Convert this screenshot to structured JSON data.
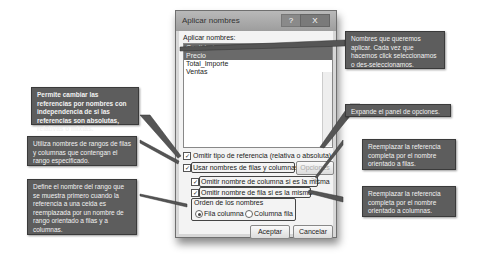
{
  "dialog": {
    "title": "Aplicar nombres",
    "help_button": "?",
    "close_button": "X",
    "list_label": "Aplicar nombres:",
    "names": [
      {
        "label": "Cantidad",
        "selected": true
      },
      {
        "label": "Precio",
        "selected": true
      },
      {
        "label": "Total_Importe",
        "selected": false
      },
      {
        "label": "Ventas",
        "selected": false
      }
    ],
    "omit_reference_type": {
      "label": "Omitir tipo de referencia (relativa o absoluta)",
      "checked": true
    },
    "use_row_column_names": {
      "label": "Usar nombres de filas y columnas",
      "checked": true
    },
    "options_button": "Opciones >>",
    "omit_column_name": {
      "label": "Omitir nombre de columna si es la misma",
      "checked": true
    },
    "omit_row_name": {
      "label": "Omitir nombre de fila si es la misma",
      "checked": true
    },
    "order_group_label": "Orden de los nombres",
    "order_options": [
      {
        "label": "Fila columna",
        "selected": true
      },
      {
        "label": "Columna fila",
        "selected": false
      }
    ],
    "ok_button": "Aceptar",
    "cancel_button": "Cancelar"
  },
  "callouts": {
    "names_list": "Nombres que queremos aplicar. Cada vez que hacemos click seleccionamos o des-seleccionamos.",
    "options": "Expande el panel de opciones.",
    "omit_type": "Permite cambiar las referencias por nombres con independencia de si las referencias son absolutas, relativas o mixtas.",
    "use_names": "Utiliza nombres de rangos de filas y columnas que contengan el rango especificado.",
    "order": "Define el nombre del rango que se muestra primero cuando la referencia a una celda es reemplazada por un nombre de rango orientado a filas y a columnas.",
    "omit_row": "Reemplazar la referencia completa por el nombre orientado a filas.",
    "omit_column": "Reemplazar la referencia completa por el nombre orientado a columnas."
  }
}
